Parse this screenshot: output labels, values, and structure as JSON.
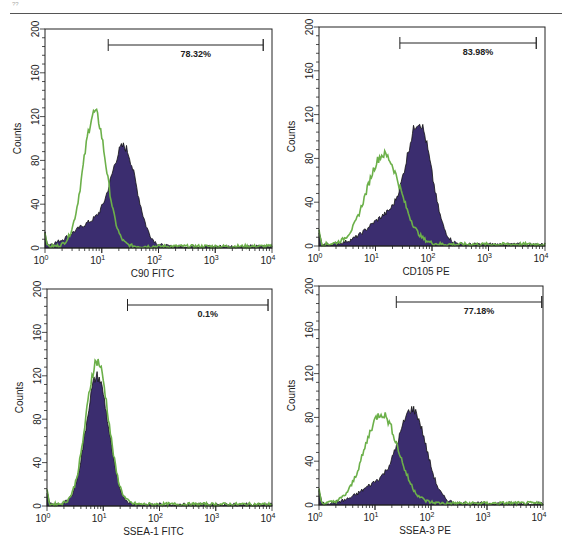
{
  "page": {
    "mark": "??"
  },
  "colors": {
    "stained_fill": "#3b2d6f",
    "stained_edge": "#111111",
    "isotype_line": "#6cb04a",
    "axis": "#222222"
  },
  "chart_data": [
    {
      "type": "histogram",
      "title": "",
      "xlabel": "C90 FITC",
      "ylabel": "Counts",
      "xscale": "log",
      "xlim": [
        1,
        10000
      ],
      "ylim": [
        0,
        200
      ],
      "xticks": [
        "10^0",
        "10^1",
        "10^2",
        "10^3",
        "10^4"
      ],
      "yticks": [
        0,
        40,
        80,
        120,
        160,
        200
      ],
      "gate": {
        "from": 13,
        "to": 7000,
        "label": "78.32%"
      },
      "series": [
        {
          "name": "Isotype control",
          "style": "line",
          "color": "#6cb04a",
          "peak_x": 7.5,
          "peak_y": 122,
          "width_log": 0.2
        },
        {
          "name": "C90 FITC",
          "style": "filled",
          "color": "#3b2d6f",
          "peak_x": 25,
          "peak_y": 85,
          "width_log": 0.22,
          "shoulder": true
        }
      ]
    },
    {
      "type": "histogram",
      "title": "",
      "xlabel": "CD105 PE",
      "ylabel": "Counts",
      "xscale": "log",
      "xlim": [
        1,
        10000
      ],
      "ylim": [
        0,
        200
      ],
      "xticks": [
        "10^0",
        "10^1",
        "10^2",
        "10^3",
        "10^4"
      ],
      "yticks": [
        0,
        40,
        80,
        120,
        160,
        200
      ],
      "gate": {
        "from": 27,
        "to": 7000,
        "label": "83.98%"
      },
      "series": [
        {
          "name": "Isotype control",
          "style": "line",
          "color": "#6cb04a",
          "peak_x": 14,
          "peak_y": 82,
          "width_log": 0.3
        },
        {
          "name": "CD105 PE",
          "style": "filled",
          "color": "#3b2d6f",
          "peak_x": 60,
          "peak_y": 104,
          "width_log": 0.22,
          "shoulder": true
        }
      ]
    },
    {
      "type": "histogram",
      "title": "",
      "xlabel": "SSEA-1 FITC",
      "ylabel": "Counts",
      "xscale": "log",
      "xlim": [
        1,
        10000
      ],
      "ylim": [
        0,
        200
      ],
      "xticks": [
        "10^0",
        "10^1",
        "10^2",
        "10^3",
        "10^4"
      ],
      "yticks": [
        0,
        40,
        80,
        120,
        160,
        200
      ],
      "gate": {
        "from": 27,
        "to": 8500,
        "label": "0.1%"
      },
      "series": [
        {
          "name": "Isotype control",
          "style": "line",
          "color": "#6cb04a",
          "peak_x": 7.8,
          "peak_y": 132,
          "width_log": 0.2
        },
        {
          "name": "SSEA-1 FITC",
          "style": "filled",
          "color": "#3b2d6f",
          "peak_x": 7.8,
          "peak_y": 118,
          "width_log": 0.2
        }
      ]
    },
    {
      "type": "histogram",
      "title": "",
      "xlabel": "SSEA-3 PE",
      "ylabel": "Counts",
      "xscale": "log",
      "xlim": [
        1,
        10000
      ],
      "ylim": [
        0,
        200
      ],
      "xticks": [
        "10^0",
        "10^1",
        "10^2",
        "10^3",
        "10^4"
      ],
      "yticks": [
        0,
        40,
        80,
        120,
        160,
        200
      ],
      "gate": {
        "from": 24,
        "to": 9500,
        "label": "77.18%"
      },
      "series": [
        {
          "name": "Isotype control",
          "style": "line",
          "color": "#6cb04a",
          "peak_x": 13,
          "peak_y": 82,
          "width_log": 0.3
        },
        {
          "name": "SSEA-3 PE",
          "style": "filled",
          "color": "#3b2d6f",
          "peak_x": 48,
          "peak_y": 80,
          "width_log": 0.24,
          "shoulder": true
        }
      ]
    }
  ],
  "panels": [
    {
      "x": 45,
      "y": 29,
      "w": 227,
      "h": 219
    },
    {
      "x": 319,
      "y": 27,
      "w": 226,
      "h": 219
    },
    {
      "x": 47,
      "y": 289,
      "w": 225,
      "h": 217
    },
    {
      "x": 319,
      "y": 286,
      "w": 224,
      "h": 219
    }
  ]
}
